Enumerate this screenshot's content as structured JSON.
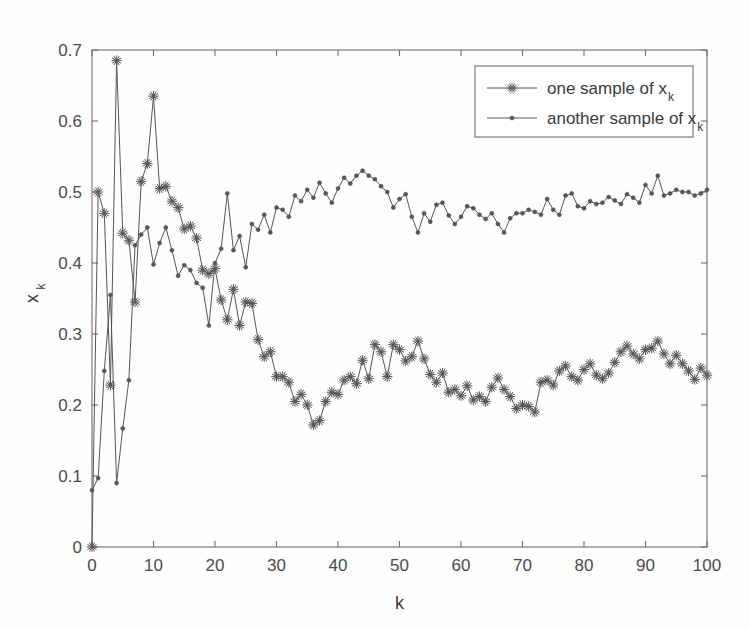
{
  "chart_data": {
    "type": "line",
    "title": "",
    "xlabel": "k",
    "ylabel": "x_k",
    "ylabel_base": "x",
    "ylabel_sub": "k",
    "xlim": [
      0,
      100
    ],
    "ylim": [
      0,
      0.7
    ],
    "grid": false,
    "legend_position": "top-right",
    "x_ticks": [
      0,
      10,
      20,
      30,
      40,
      50,
      60,
      70,
      80,
      90,
      100
    ],
    "x_tick_labels": [
      "0",
      "10",
      "20",
      "30",
      "40",
      "50",
      "60",
      "70",
      "80",
      "90",
      "100"
    ],
    "y_ticks": [
      0,
      0.1,
      0.2,
      0.3,
      0.4,
      0.5,
      0.6,
      0.7
    ],
    "y_tick_labels": [
      "0",
      "0.1",
      "0.2",
      "0.3",
      "0.4",
      "0.5",
      "0.6",
      "0.7"
    ],
    "x": [
      0,
      1,
      2,
      3,
      4,
      5,
      6,
      7,
      8,
      9,
      10,
      11,
      12,
      13,
      14,
      15,
      16,
      17,
      18,
      19,
      20,
      21,
      22,
      23,
      24,
      25,
      26,
      27,
      28,
      29,
      30,
      31,
      32,
      33,
      34,
      35,
      36,
      37,
      38,
      39,
      40,
      41,
      42,
      43,
      44,
      45,
      46,
      47,
      48,
      49,
      50,
      51,
      52,
      53,
      54,
      55,
      56,
      57,
      58,
      59,
      60,
      61,
      62,
      63,
      64,
      65,
      66,
      67,
      68,
      69,
      70,
      71,
      72,
      73,
      74,
      75,
      76,
      77,
      78,
      79,
      80,
      81,
      82,
      83,
      84,
      85,
      86,
      87,
      88,
      89,
      90,
      91,
      92,
      93,
      94,
      95,
      96,
      97,
      98,
      99,
      100
    ],
    "series": [
      {
        "name": "one sample of x_k",
        "name_base": "one sample of x",
        "name_sub": "k",
        "marker": "star",
        "color": "#555555",
        "values": [
          0.0,
          0.5,
          0.47,
          0.228,
          0.685,
          0.442,
          0.432,
          0.345,
          0.515,
          0.54,
          0.635,
          0.505,
          0.508,
          0.487,
          0.478,
          0.448,
          0.452,
          0.435,
          0.39,
          0.385,
          0.392,
          0.348,
          0.32,
          0.363,
          0.312,
          0.345,
          0.343,
          0.292,
          0.268,
          0.275,
          0.24,
          0.24,
          0.232,
          0.205,
          0.215,
          0.2,
          0.172,
          0.178,
          0.205,
          0.218,
          0.215,
          0.235,
          0.24,
          0.23,
          0.263,
          0.237,
          0.285,
          0.275,
          0.24,
          0.285,
          0.278,
          0.262,
          0.268,
          0.29,
          0.265,
          0.243,
          0.232,
          0.245,
          0.218,
          0.222,
          0.213,
          0.227,
          0.207,
          0.212,
          0.205,
          0.225,
          0.238,
          0.222,
          0.212,
          0.195,
          0.2,
          0.198,
          0.19,
          0.232,
          0.235,
          0.228,
          0.248,
          0.255,
          0.24,
          0.235,
          0.25,
          0.258,
          0.242,
          0.237,
          0.245,
          0.26,
          0.275,
          0.283,
          0.272,
          0.265,
          0.278,
          0.28,
          0.29,
          0.272,
          0.258,
          0.27,
          0.258,
          0.248,
          0.236,
          0.252,
          0.242
        ]
      },
      {
        "name": "another sample of x_k",
        "name_base": "another sample of x",
        "name_sub": "k",
        "marker": "dot",
        "color": "#555555",
        "values": [
          0.08,
          0.097,
          0.248,
          0.355,
          0.09,
          0.167,
          0.235,
          0.425,
          0.44,
          0.45,
          0.398,
          0.428,
          0.45,
          0.418,
          0.382,
          0.397,
          0.39,
          0.372,
          0.365,
          0.312,
          0.4,
          0.42,
          0.498,
          0.418,
          0.438,
          0.394,
          0.455,
          0.447,
          0.468,
          0.443,
          0.478,
          0.475,
          0.465,
          0.495,
          0.487,
          0.503,
          0.492,
          0.513,
          0.498,
          0.485,
          0.505,
          0.52,
          0.512,
          0.523,
          0.53,
          0.523,
          0.518,
          0.508,
          0.5,
          0.478,
          0.49,
          0.497,
          0.465,
          0.443,
          0.47,
          0.458,
          0.482,
          0.485,
          0.467,
          0.455,
          0.465,
          0.48,
          0.477,
          0.468,
          0.462,
          0.47,
          0.455,
          0.443,
          0.463,
          0.47,
          0.47,
          0.475,
          0.472,
          0.468,
          0.49,
          0.475,
          0.468,
          0.495,
          0.498,
          0.48,
          0.477,
          0.487,
          0.483,
          0.485,
          0.493,
          0.488,
          0.483,
          0.497,
          0.492,
          0.485,
          0.51,
          0.498,
          0.523,
          0.495,
          0.498,
          0.503,
          0.5,
          0.5,
          0.495,
          0.498,
          0.503
        ]
      }
    ]
  },
  "legend": {
    "entries": [
      {
        "label_base": "one sample of x",
        "label_sub": "k",
        "marker": "star"
      },
      {
        "label_base": "another sample of x",
        "label_sub": "k",
        "marker": "dot"
      }
    ]
  }
}
